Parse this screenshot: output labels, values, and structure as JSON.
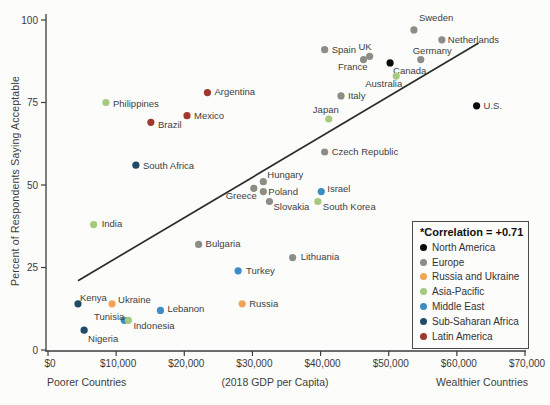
{
  "chart_data": {
    "type": "scatter",
    "title": "",
    "ylabel": "Percent of Respondents Saying Acceptable",
    "xlabel_left": "Poorer Countries",
    "xlabel_center": "(2018 GDP per Capita)",
    "xlabel_right": "Wealthier Countries",
    "xlim": [
      0,
      70000
    ],
    "ylim": [
      0,
      100
    ],
    "x_ticks": [
      {
        "value": 0,
        "label": "$0"
      },
      {
        "value": 10000,
        "label": "$10,000"
      },
      {
        "value": 20000,
        "label": "$20,000"
      },
      {
        "value": 30000,
        "label": "$30,000"
      },
      {
        "value": 40000,
        "label": "$40,000"
      },
      {
        "value": 50000,
        "label": "$50,000"
      },
      {
        "value": 60000,
        "label": "$60,000"
      },
      {
        "value": 70000,
        "label": "$70,000"
      }
    ],
    "y_ticks": [
      {
        "value": 0,
        "label": "0"
      },
      {
        "value": 25,
        "label": "25"
      },
      {
        "value": 50,
        "label": "50"
      },
      {
        "value": 75,
        "label": "75"
      },
      {
        "value": 100,
        "label": "100"
      }
    ],
    "trendline": {
      "x1": 4400,
      "y1": 21,
      "x2": 63200,
      "y2": 93
    },
    "legend": {
      "title": "*Correlation = +0.71",
      "items": [
        {
          "label": "North America",
          "color": "#0a0a0a"
        },
        {
          "label": "Europe",
          "color": "#8d8d85"
        },
        {
          "label": "Russia and Ukraine",
          "color": "#f0a455"
        },
        {
          "label": "Asia-Pacific",
          "color": "#a5c97d"
        },
        {
          "label": "Middle East",
          "color": "#3b8dc6"
        },
        {
          "label": "Sub-Saharan Africa",
          "color": "#1f4a68"
        },
        {
          "label": "Latin America",
          "color": "#9f382d"
        }
      ]
    },
    "region_colors": {
      "North America": "#0a0a0a",
      "Europe": "#8d8d85",
      "Russia and Ukraine": "#f0a455",
      "Asia-Pacific": "#a5c97d",
      "Middle East": "#3b8dc6",
      "Sub-Saharan Africa": "#1f4a68",
      "Latin America": "#9f382d"
    },
    "points": [
      {
        "country": "Sweden",
        "region": "Europe",
        "gdp": 53700,
        "pct": 97,
        "label": {
          "anchor": "left",
          "dx": 5,
          "dy": -12
        }
      },
      {
        "country": "Netherlands",
        "region": "Europe",
        "gdp": 57800,
        "pct": 94,
        "label": {
          "anchor": "left",
          "dx": 6,
          "dy": 0
        }
      },
      {
        "country": "Spain",
        "region": "Europe",
        "gdp": 40600,
        "pct": 91,
        "label": {
          "anchor": "left",
          "dx": 7,
          "dy": 0
        }
      },
      {
        "country": "UK",
        "region": "Europe",
        "gdp": 47200,
        "pct": 89,
        "label": {
          "anchor": "right",
          "dx": 2,
          "dy": -10
        }
      },
      {
        "country": "France",
        "region": "Europe",
        "gdp": 46300,
        "pct": 88,
        "label": {
          "anchor": "right",
          "dx": 4,
          "dy": 7
        }
      },
      {
        "country": "Germany",
        "region": "Europe",
        "gdp": 54700,
        "pct": 88,
        "label": {
          "anchor": "left",
          "dx": -8,
          "dy": -9
        }
      },
      {
        "country": "Canada",
        "region": "North America",
        "gdp": 50200,
        "pct": 87,
        "label": {
          "anchor": "left",
          "dx": 3,
          "dy": 8
        }
      },
      {
        "country": "Australia",
        "region": "Asia-Pacific",
        "gdp": 51100,
        "pct": 83,
        "label": {
          "anchor": "right",
          "dx": 6,
          "dy": 8
        }
      },
      {
        "country": "Argentina",
        "region": "Latin America",
        "gdp": 23400,
        "pct": 78,
        "label": {
          "anchor": "left",
          "dx": 7,
          "dy": -1
        }
      },
      {
        "country": "Italy",
        "region": "Europe",
        "gdp": 43000,
        "pct": 77,
        "label": {
          "anchor": "left",
          "dx": 7,
          "dy": 0
        }
      },
      {
        "country": "Philippines",
        "region": "Asia-Pacific",
        "gdp": 8500,
        "pct": 75,
        "label": {
          "anchor": "left",
          "dx": 7,
          "dy": 1
        }
      },
      {
        "country": "U.S.",
        "region": "North America",
        "gdp": 62900,
        "pct": 74,
        "label": {
          "anchor": "left",
          "dx": 7,
          "dy": 0
        }
      },
      {
        "country": "Mexico",
        "region": "Latin America",
        "gdp": 20400,
        "pct": 71,
        "label": {
          "anchor": "left",
          "dx": 7,
          "dy": 0
        }
      },
      {
        "country": "Japan",
        "region": "Asia-Pacific",
        "gdp": 41200,
        "pct": 70,
        "label": {
          "anchor": "right",
          "dx": 10,
          "dy": -9
        }
      },
      {
        "country": "Brazil",
        "region": "Latin America",
        "gdp": 15100,
        "pct": 69,
        "label": {
          "anchor": "left",
          "dx": 7,
          "dy": 2
        }
      },
      {
        "country": "Czech Republic",
        "region": "Europe",
        "gdp": 40600,
        "pct": 60,
        "label": {
          "anchor": "left",
          "dx": 7,
          "dy": 0
        }
      },
      {
        "country": "South Africa",
        "region": "Sub-Saharan Africa",
        "gdp": 12900,
        "pct": 56,
        "label": {
          "anchor": "left",
          "dx": 7,
          "dy": 0
        }
      },
      {
        "country": "Hungary",
        "region": "Europe",
        "gdp": 31600,
        "pct": 51,
        "label": {
          "anchor": "left",
          "dx": 4,
          "dy": -7
        }
      },
      {
        "country": "Greece",
        "region": "Europe",
        "gdp": 30200,
        "pct": 49,
        "label": {
          "anchor": "right",
          "dx": 3,
          "dy": 7
        }
      },
      {
        "country": "Poland",
        "region": "Europe",
        "gdp": 31600,
        "pct": 48,
        "label": {
          "anchor": "left",
          "dx": 5,
          "dy": 0
        }
      },
      {
        "country": "Israel",
        "region": "Middle East",
        "gdp": 40100,
        "pct": 48,
        "label": {
          "anchor": "left",
          "dx": 6,
          "dy": -3
        }
      },
      {
        "country": "Slovakia",
        "region": "Europe",
        "gdp": 32500,
        "pct": 45,
        "label": {
          "anchor": "left",
          "dx": 4,
          "dy": 5
        }
      },
      {
        "country": "South Korea",
        "region": "Asia-Pacific",
        "gdp": 39600,
        "pct": 45,
        "label": {
          "anchor": "left",
          "dx": 5,
          "dy": 5
        }
      },
      {
        "country": "India",
        "region": "Asia-Pacific",
        "gdp": 6700,
        "pct": 38,
        "label": {
          "anchor": "left",
          "dx": 8,
          "dy": -1
        }
      },
      {
        "country": "Bulgaria",
        "region": "Europe",
        "gdp": 22100,
        "pct": 32,
        "label": {
          "anchor": "left",
          "dx": 7,
          "dy": -1
        }
      },
      {
        "country": "Lithuania",
        "region": "Europe",
        "gdp": 35900,
        "pct": 28,
        "label": {
          "anchor": "left",
          "dx": 8,
          "dy": -1
        }
      },
      {
        "country": "Turkey",
        "region": "Middle East",
        "gdp": 27900,
        "pct": 24,
        "label": {
          "anchor": "left",
          "dx": 8,
          "dy": 0
        }
      },
      {
        "country": "Kenya",
        "region": "Sub-Saharan Africa",
        "gdp": 4400,
        "pct": 14,
        "label": {
          "anchor": "left",
          "dx": 2,
          "dy": -6
        }
      },
      {
        "country": "Ukraine",
        "region": "Russia and Ukraine",
        "gdp": 9400,
        "pct": 14,
        "label": {
          "anchor": "left",
          "dx": 6,
          "dy": -4
        }
      },
      {
        "country": "Russia",
        "region": "Russia and Ukraine",
        "gdp": 28500,
        "pct": 14,
        "label": {
          "anchor": "left",
          "dx": 7,
          "dy": 0
        }
      },
      {
        "country": "Lebanon",
        "region": "Middle East",
        "gdp": 16500,
        "pct": 12,
        "label": {
          "anchor": "left",
          "dx": 7,
          "dy": -2
        }
      },
      {
        "country": "Tunisia",
        "region": "Middle East",
        "gdp": 11200,
        "pct": 9,
        "label": {
          "anchor": "right",
          "dx": 0,
          "dy": -4
        }
      },
      {
        "country": "Indonesia",
        "region": "Asia-Pacific",
        "gdp": 11800,
        "pct": 9,
        "label": {
          "anchor": "left",
          "dx": 5,
          "dy": 5
        }
      },
      {
        "country": "Nigeria",
        "region": "Sub-Saharan Africa",
        "gdp": 5300,
        "pct": 6,
        "label": {
          "anchor": "left",
          "dx": 4,
          "dy": 8
        }
      }
    ]
  }
}
